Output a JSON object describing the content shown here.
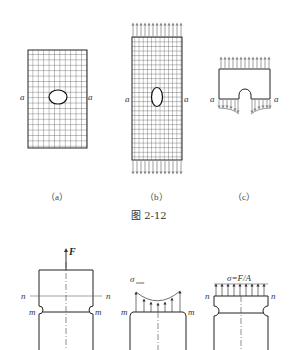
{
  "figure": {
    "number_label": "图 2-12",
    "panels_top": [
      {
        "id": "a",
        "caption": "（a）",
        "section_label_left": "a",
        "section_label_right": "a",
        "hole": "circular",
        "load": "none"
      },
      {
        "id": "b",
        "caption": "（b）",
        "section_label_left": "a",
        "section_label_right": "a",
        "hole": "elongated ellipse",
        "load": "uniform tension top and bottom"
      },
      {
        "id": "c",
        "caption": "（c）",
        "section_label_left": "a",
        "section_label_right": "a",
        "hole": "semicircular notch",
        "load": "stress distribution at section a-a"
      }
    ],
    "panels_bottom": [
      {
        "id": "notched-bar",
        "force_label": "F",
        "section_n_left": "n",
        "section_n_right": "n",
        "section_m_left": "m",
        "section_m_right": "m"
      },
      {
        "id": "stress-concentration",
        "stress_label": "σ",
        "stress_subscript": "max",
        "section_m_left": "m",
        "section_m_right": "m"
      },
      {
        "id": "nominal-stress",
        "stress_label": "σ=F/A",
        "section_n_left": "n",
        "section_n_right": "n"
      }
    ]
  },
  "colors": {
    "line": "#222222",
    "grid": "#333333",
    "arrow": "#888888",
    "centerline": "#444444"
  }
}
